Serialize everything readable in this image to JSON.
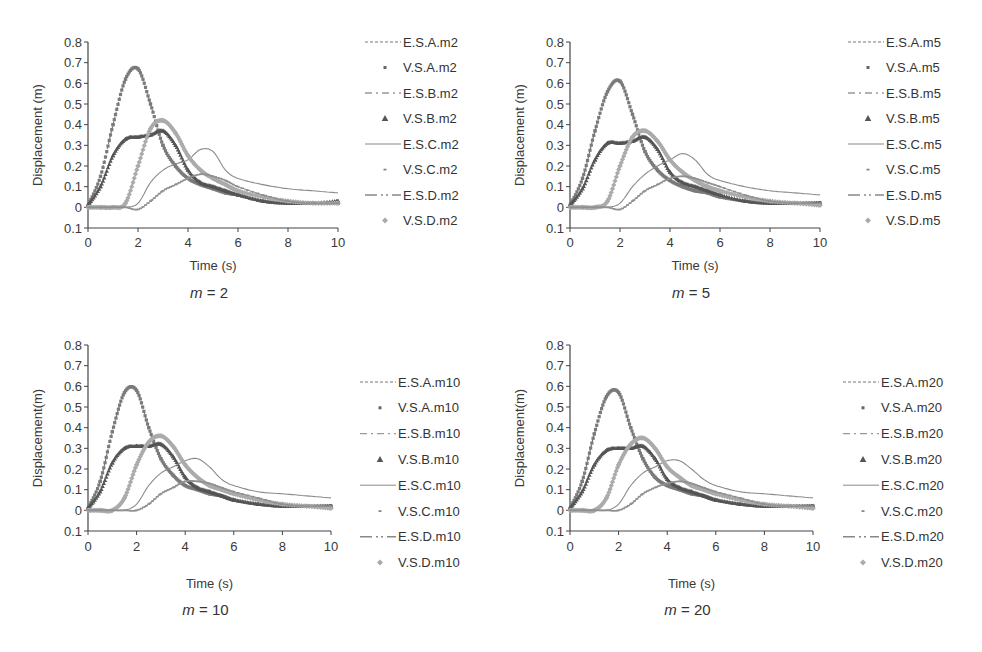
{
  "chart_data": [
    {
      "type": "line",
      "title": "m = 2",
      "caption_var": "m",
      "caption_val": "2",
      "xlabel": "Time (s)",
      "ylabel": "Displacement (m)",
      "xlim": [
        0,
        10
      ],
      "ylim": [
        -0.1,
        0.8
      ],
      "xticks": [
        "0",
        "2",
        "4",
        "6",
        "8",
        "10"
      ],
      "yticks": [
        "0.8",
        "0.7",
        "0.6",
        "0.5",
        "0.4",
        "0.3",
        "0.2",
        "0.1",
        "0",
        "0.1"
      ],
      "grid": false,
      "legend_position": "right",
      "legend": [
        "E.S.A.m2",
        "V.S.A.m2",
        "E.S.B.m2",
        "V.S.B.m2",
        "E.S.C.m2",
        "V.S.C.m2",
        "E.S.D.m2",
        "V.S.D.m2"
      ],
      "x": [
        0,
        0.5,
        1,
        1.5,
        2,
        2.5,
        3,
        3.5,
        4,
        4.5,
        5,
        5.5,
        6,
        7,
        8,
        9,
        10
      ],
      "series": [
        {
          "name": "Site A",
          "values": [
            0.01,
            0.15,
            0.4,
            0.62,
            0.67,
            0.5,
            0.3,
            0.2,
            0.14,
            0.11,
            0.09,
            0.07,
            0.06,
            0.03,
            0.02,
            0.02,
            0.02
          ]
        },
        {
          "name": "Site B",
          "values": [
            0.01,
            0.1,
            0.25,
            0.33,
            0.34,
            0.35,
            0.37,
            0.3,
            0.18,
            0.12,
            0.1,
            0.08,
            0.06,
            0.03,
            0.02,
            0.02,
            0.03
          ]
        },
        {
          "name": "Site C",
          "values": [
            0,
            0,
            0,
            0,
            0.02,
            0.12,
            0.18,
            0.21,
            0.23,
            0.28,
            0.27,
            0.18,
            0.14,
            0.11,
            0.09,
            0.08,
            0.07
          ]
        },
        {
          "name": "Site D",
          "values": [
            0,
            0,
            0,
            0.02,
            0.2,
            0.38,
            0.42,
            0.36,
            0.25,
            0.18,
            0.14,
            0.11,
            0.08,
            0.05,
            0.03,
            0.02,
            0.02
          ]
        },
        {
          "name": "Site C low",
          "values": [
            0,
            0,
            0,
            0,
            -0.01,
            0.03,
            0.08,
            0.11,
            0.14,
            0.16,
            0.15,
            0.13,
            0.1,
            0.06,
            0.03,
            0.02,
            0.02
          ]
        }
      ]
    },
    {
      "type": "line",
      "title": "m = 5",
      "caption_var": "m",
      "caption_val": "5",
      "xlabel": "Time (s)",
      "ylabel": "Displacement (m)",
      "xlim": [
        0,
        10
      ],
      "ylim": [
        -0.1,
        0.8
      ],
      "xticks": [
        "0",
        "2",
        "4",
        "6",
        "8",
        "10"
      ],
      "yticks": [
        "0.8",
        "0.7",
        "0.6",
        "0.5",
        "0.4",
        "0.3",
        "0.2",
        "0.1",
        "0",
        "0.1"
      ],
      "grid": false,
      "legend_position": "right",
      "legend": [
        "E.S.A.m5",
        "V.S.A.m5",
        "E.S.B.m5",
        "V.S.B.m5",
        "E.S.C.m5",
        "V.S.C.m5",
        "E.S.D.m5",
        "V.S.D.m5"
      ],
      "x": [
        0,
        0.5,
        1,
        1.5,
        2,
        2.5,
        3,
        3.5,
        4,
        4.5,
        5,
        5.5,
        6,
        7,
        8,
        9,
        10
      ],
      "series": [
        {
          "name": "Site A",
          "values": [
            0.01,
            0.14,
            0.37,
            0.56,
            0.61,
            0.45,
            0.27,
            0.18,
            0.13,
            0.1,
            0.08,
            0.07,
            0.05,
            0.03,
            0.02,
            0.02,
            0.02
          ]
        },
        {
          "name": "Site B",
          "values": [
            0.01,
            0.09,
            0.23,
            0.31,
            0.31,
            0.32,
            0.34,
            0.28,
            0.17,
            0.12,
            0.1,
            0.08,
            0.06,
            0.03,
            0.02,
            0.02,
            0.02
          ]
        },
        {
          "name": "Site C",
          "values": [
            0,
            0,
            0,
            0,
            0.02,
            0.1,
            0.16,
            0.2,
            0.23,
            0.26,
            0.23,
            0.16,
            0.13,
            0.1,
            0.08,
            0.07,
            0.06
          ]
        },
        {
          "name": "Site D",
          "values": [
            0,
            0,
            0,
            0.03,
            0.2,
            0.34,
            0.37,
            0.32,
            0.23,
            0.17,
            0.13,
            0.1,
            0.08,
            0.05,
            0.03,
            0.02,
            0.01
          ]
        },
        {
          "name": "Site C low",
          "values": [
            0,
            0,
            0,
            0,
            -0.01,
            0.03,
            0.08,
            0.11,
            0.14,
            0.15,
            0.14,
            0.12,
            0.1,
            0.06,
            0.03,
            0.02,
            0.02
          ]
        }
      ]
    },
    {
      "type": "line",
      "title": "m = 10",
      "caption_var": "m",
      "caption_val": "10",
      "xlabel": "Time (s)",
      "ylabel": "Displacement(m)",
      "xlim": [
        0,
        10
      ],
      "ylim": [
        -0.1,
        0.8
      ],
      "xticks": [
        "0",
        "2",
        "4",
        "6",
        "8",
        "10"
      ],
      "yticks": [
        "0.8",
        "0.7",
        "0.6",
        "0.5",
        "0.4",
        "0.3",
        "0.2",
        "0.1",
        "0",
        "0.1"
      ],
      "grid": false,
      "legend_position": "right",
      "legend": [
        "E.S.A.m10",
        "V.S.A.m10",
        "E.S.B.m10",
        "V.S.B.m10",
        "E.S.C.m10",
        "V.S.C.m10",
        "E.S.D.m10",
        "V.S.D.m10"
      ],
      "x": [
        0,
        0.5,
        1,
        1.5,
        2,
        2.5,
        3,
        3.5,
        4,
        4.5,
        5,
        5.5,
        6,
        7,
        8,
        9,
        10
      ],
      "series": [
        {
          "name": "Site A",
          "values": [
            0.01,
            0.14,
            0.38,
            0.57,
            0.58,
            0.4,
            0.25,
            0.17,
            0.12,
            0.1,
            0.08,
            0.07,
            0.05,
            0.03,
            0.02,
            0.02,
            0.02
          ]
        },
        {
          "name": "Site B",
          "values": [
            0.01,
            0.09,
            0.23,
            0.3,
            0.31,
            0.31,
            0.32,
            0.26,
            0.16,
            0.11,
            0.09,
            0.07,
            0.05,
            0.03,
            0.02,
            0.02,
            0.02
          ]
        },
        {
          "name": "Site C",
          "values": [
            0,
            0,
            0,
            0,
            0.03,
            0.12,
            0.18,
            0.21,
            0.24,
            0.25,
            0.21,
            0.15,
            0.12,
            0.09,
            0.08,
            0.07,
            0.06
          ]
        },
        {
          "name": "Site D",
          "values": [
            0,
            0,
            0,
            0.06,
            0.22,
            0.33,
            0.36,
            0.31,
            0.22,
            0.16,
            0.12,
            0.1,
            0.08,
            0.05,
            0.03,
            0.02,
            0.01
          ]
        },
        {
          "name": "Site C low",
          "values": [
            0,
            0,
            0,
            0,
            0,
            0.03,
            0.08,
            0.11,
            0.14,
            0.14,
            0.13,
            0.11,
            0.09,
            0.06,
            0.03,
            0.02,
            0.02
          ]
        }
      ]
    },
    {
      "type": "line",
      "title": "m = 20",
      "caption_var": "m",
      "caption_val": "20",
      "xlabel": "Time (s)",
      "ylabel": "Displacement(m)",
      "xlim": [
        0,
        10
      ],
      "ylim": [
        -0.1,
        0.8
      ],
      "xticks": [
        "0",
        "2",
        "4",
        "6",
        "8",
        "10"
      ],
      "yticks": [
        "0.8",
        "0.7",
        "0.6",
        "0.5",
        "0.4",
        "0.3",
        "0.2",
        "0.1",
        "0",
        "0.1"
      ],
      "grid": false,
      "legend_position": "right",
      "legend": [
        "E.S.A.m20",
        "V.S.A.m20",
        "E.S.B.m20",
        "V.S.B.m20",
        "E.S.C.m20",
        "V.S.C.m20",
        "E.S.D.m20",
        "V.S.D.m20"
      ],
      "x": [
        0,
        0.5,
        1,
        1.5,
        2,
        2.5,
        3,
        3.5,
        4,
        4.5,
        5,
        5.5,
        6,
        7,
        8,
        9,
        10
      ],
      "series": [
        {
          "name": "Site A",
          "values": [
            0.01,
            0.14,
            0.37,
            0.55,
            0.57,
            0.4,
            0.25,
            0.16,
            0.12,
            0.1,
            0.08,
            0.07,
            0.05,
            0.03,
            0.02,
            0.02,
            0.02
          ]
        },
        {
          "name": "Site B",
          "values": [
            0.01,
            0.09,
            0.22,
            0.29,
            0.3,
            0.3,
            0.31,
            0.25,
            0.15,
            0.11,
            0.09,
            0.07,
            0.05,
            0.03,
            0.02,
            0.02,
            0.02
          ]
        },
        {
          "name": "Site C",
          "values": [
            0,
            0,
            0,
            0,
            0.03,
            0.12,
            0.18,
            0.21,
            0.24,
            0.24,
            0.2,
            0.15,
            0.12,
            0.09,
            0.08,
            0.07,
            0.06
          ]
        },
        {
          "name": "Site D",
          "values": [
            0,
            0,
            0,
            0.06,
            0.22,
            0.32,
            0.35,
            0.3,
            0.21,
            0.16,
            0.12,
            0.1,
            0.08,
            0.05,
            0.03,
            0.02,
            0.01
          ]
        },
        {
          "name": "Site C low",
          "values": [
            0,
            0,
            0,
            0,
            0,
            0.03,
            0.08,
            0.11,
            0.13,
            0.14,
            0.13,
            0.11,
            0.09,
            0.06,
            0.03,
            0.02,
            0.02
          ]
        }
      ]
    }
  ],
  "colors": {
    "site_a": "#6e6e6e",
    "site_b": "#4a4a4a",
    "site_c": "#8a8a8a",
    "site_d": "#a8a8a8",
    "axis": "#444444"
  }
}
